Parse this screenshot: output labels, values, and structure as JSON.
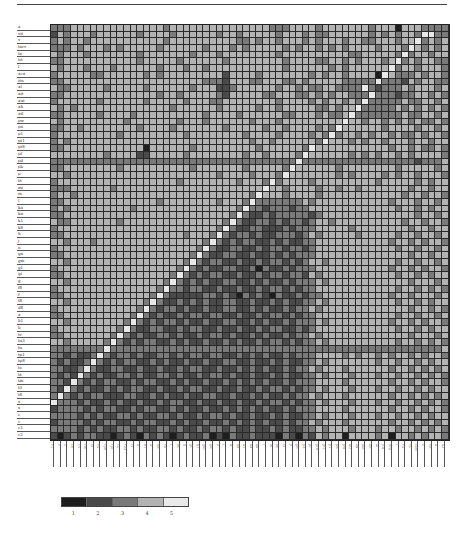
{
  "chart_data": {
    "type": "heatmap",
    "title": "",
    "xlabel": "",
    "ylabel": "",
    "n_rows": 62,
    "n_cols": 60,
    "diagonal": "bottom-left to top-right (value 5, white)",
    "row_labels": [
      "a",
      "vit",
      "v",
      "tarv",
      "ta",
      "tit",
      "l",
      "aca",
      "itn",
      "al",
      "ait",
      "aut",
      "ah",
      "atl",
      "pw",
      "pn",
      "p1",
      "pt1",
      "pt8",
      "pf",
      "pd",
      "pb",
      "p",
      "ts",
      "mi",
      "m",
      "l",
      "ka",
      "kn",
      "k1",
      "k8",
      "h",
      "j",
      "ii",
      "gn",
      "gm",
      "g1",
      "gt",
      "g",
      "f8",
      "f",
      "t8",
      "d8",
      "a",
      "b1",
      "b",
      "tv",
      "tu3",
      "tu",
      "tp1",
      "tp8",
      "to",
      "ts",
      "tm",
      "t3",
      "t8",
      "s",
      "s",
      "c",
      "c",
      "c1",
      "c2"
    ],
    "col_labels": [
      "c1",
      "c",
      "s",
      "t8",
      "t3",
      "tm",
      "ts",
      "to",
      "tp8",
      "tp1",
      "tu",
      "tu3",
      "tv",
      "b",
      "b1",
      "a",
      "d8",
      "t8",
      "f",
      "f8",
      "g",
      "gt",
      "g1",
      "gm",
      "gn",
      "ii",
      "j",
      "h",
      "k8",
      "k1",
      "kn",
      "ka",
      "l",
      "m",
      "mi",
      "ts",
      "p",
      "pb",
      "pd",
      "pf",
      "pt8",
      "pt1",
      "p1",
      "pn",
      "pw",
      "atl",
      "ah",
      "aut",
      "ait",
      "al",
      "itn",
      "aca",
      "l",
      "tit",
      "ta",
      "tarv",
      "v",
      "vit",
      "a",
      "a2"
    ],
    "legend": {
      "levels": [
        1,
        2,
        3,
        4,
        5
      ],
      "labels": [
        "1",
        "2",
        "3",
        "4",
        "5"
      ],
      "colors": [
        "#1e1e1e",
        "#4a4a4a",
        "#7a7a7a",
        "#b3b3b3",
        "#e9e9e9"
      ]
    },
    "matrix": [
      "333444444444444443444444444444444333444434444444344414443333",
      "243444344444434444344444434434444434443433444444343434435533",
      "343443444444444443444444444433434434443434443443344434453434",
      "333434443434444434444443444343444443434434343444434443543434",
      "434443444444434444444344434444444434444444444334444435344344",
      "334444444444434444434444443444444443444433443434443453434433",
      "434443444344444434443443444444444443444444343444444534434443",
      "344444334444443434444444442444434444444343443444415433343443",
      "334444444444444444444443332444334443343444443333353332434433",
      "433444443444443444444344422344444434434334433335323334344434",
      "334444444444444434434444432444443344433434344333533323344343",
      "344444434444443444443444334444444434444343443435333334334434",
      "434344444444444444344444434444434434444433434453333343434343",
      "334444434444344444444443444434444443344434334533333334334434",
      "434444444443444444434443444444344434444444445443443434343343",
      "334434444444434444344444443444443443444434354444443444434434",
      "344444444434444444443444444443444434444343534434344343343443",
      "343444444444444444444444444444344344444435444343443444344344",
      "334444444444441444444344444444434444443544444444444344343343",
      "444444443444422444443444444443443444435444444343434434344443",
      "333333333333333333333333333333333333353333333333333333323334",
      "334444444434444444444344444443444443544444434444444434444434",
      "443444444444444444444444434444344435444444434344443434434443",
      "344444444444444444434444444434443534444344444444434444434344",
      "333444444344444444444444444444445443444434434434444444344344",
      "344344444444444444444444444444354443444434444444444443443443",
      "334444444444444434444444434443533333334344444444444344434434",
      "343444444444344444444444444435332333233444444444444434434344",
      "334444444444444444444444444353223233333234444444444444434434",
      "433444444434444444444444443532233232332344344444444443443443",
      "344444444444444444444444435322332223233344444344444444344344",
      "334444444444444444443444353233232233323434444434444434434434",
      "443444344444444444444443532323322323223344444444444344343443",
      "344444444444444444444435322332232332332344444444444434434434",
      "334444444444444444444353223322322323233344444444444444344344",
      "443444444444444444443532332232232332323443444444444434434434",
      "344444444444444444435323223322313223233344444444444344343443",
      "334444444444444444353232332232232332332434444444444434434344",
      "443444444444444443532323223322323223233343444444444444344434",
      "344444444444444435332332232232232332323344444444444434434343",
      "334444444444444353222223323213232132232334444444444344344434",
      "443444444444443532232323223322322323223343444444444434434344",
      "344444444444435323323223223322323223233434444444444444344343",
      "334444444444353232232332332232232332323344444444444434434434",
      "443444444443532323323223223322323223233343444444444344343443",
      "344444444435322332232332232232232332232344444444444434434344",
      "334444444353232233232232332322323223233434444444444444344434",
      "443444443532323322323223223232232332323343444444444434434343",
      "333333335333333333333333333333333333333333333333333333333334",
      "332322353233232233232332332232323223233344443434434344343443",
      "323223532323322323223223223322322323223343444444434434434344",
      "332235322332232232232332232232323223233434443444444344343434",
      "323253232233232233232232332322322323223343444344434434434343",
      "332532323322323322323223223232323223233344443444444344343443",
      "325323223232332232232332232232232332323343444344434434434344",
      "353232332223322323223223322322323223233434443444444344343434",
      "533323223232232232332232232232232332323343444344434434434343",
      "233332323322323322323223223232323223233344443444444344343443",
      "333323232233232233232232332322322323223343444344434434434344",
      "233332323322323322323223223232323223233434443444444344343434",
      "333323232233232233232232332322322323223343444344434434434343",
      "212323322123213232123223121322322213213243441444434144343443"
    ]
  }
}
